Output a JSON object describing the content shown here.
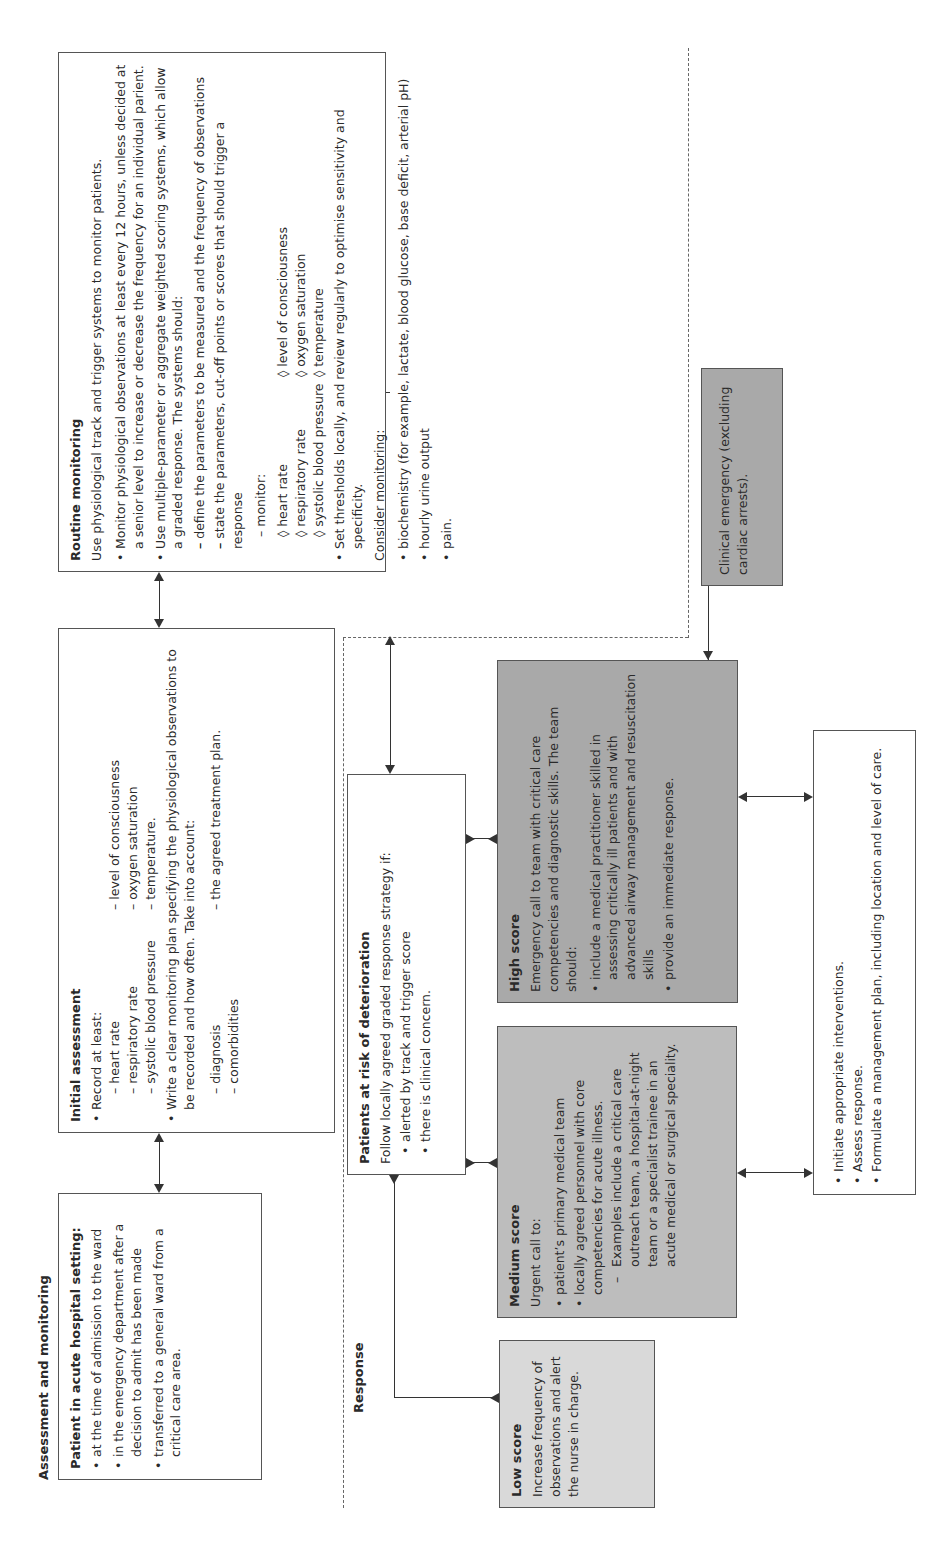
{
  "sections": {
    "assessment_title": "Assessment and monitoring",
    "response_title": "Response"
  },
  "patient_box": {
    "title": "Patient in acute hospital setting:",
    "items": [
      "at the time of admission to the ward",
      "in the emergency department after a decision to admit has been made",
      "transferred to a general ward from a critical care area."
    ]
  },
  "initial_assessment": {
    "title": "Initial assessment",
    "record_label": "Record at least:",
    "record_items": [
      "heart rate",
      "level of consciousness",
      "respiratory rate",
      "oxygen saturation",
      "systolic blood pressure",
      "temperature."
    ],
    "plan_text": "Write a clear monitoring plan specifying the physiological observations to be recorded and how often. Take into account:",
    "plan_items": [
      "diagnosis",
      "the agreed treatment plan.",
      "comorbidities",
      ""
    ]
  },
  "routine_monitoring": {
    "title": "Routine monitoring",
    "intro": "Use physiological track and trigger systems to monitor patients.",
    "bullet1": "Monitor physiological observations at least every 12 hours, unless decided at a senior level to increase or decrease the frequency for an individual parient.",
    "bullet2": "Use multiple-parameter or aggregate weighted scoring systems, which allow a graded response. The systems should:",
    "sub_items": [
      "define the parameters to be measured and the frequency of observations",
      "state the parameters, cut-off points or scores that should trigger a response"
    ],
    "monitor_label": "monitor:",
    "monitor_items": [
      "heart rate",
      "respiratory rate",
      "systolic blood pressure",
      "level of consciousness",
      "oxygen saturation",
      "temperature"
    ],
    "bullet3": "Set thresholds locally, and review regularly to optimise sensitivity and specificity.",
    "consider_label": "Consider monitoring:",
    "consider_items": [
      "biochemistry (for example, lactate, blood glucose, base deficit, arterial pH)",
      "hourly urine output",
      "pain."
    ]
  },
  "clinical_emergency": {
    "text": "Clinical emergency (excluding cardiac arrests)."
  },
  "at_risk": {
    "title": "Patients at risk of deterioration",
    "intro": "Follow locally agreed graded response strategy if:",
    "items": [
      "alerted by track and trigger score",
      "there is clinical concern."
    ]
  },
  "low_score": {
    "title": "Low score",
    "text": "Increase frequency of observations and alert the nurse in charge."
  },
  "medium_score": {
    "title": "Medium score",
    "intro": "Urgent call to:",
    "items": [
      "patient’s primary medical team",
      "locally agreed personnel with core competencies for acute illness."
    ],
    "sub_item": "Examples include a critical care outreach team, a hospital-at-night team or a specialist trainee in an acute medical or surgical speciality."
  },
  "high_score": {
    "title": "High score",
    "intro": "Emergency call to team with critical care competencies and diagnostic skills. The team should:",
    "items": [
      "include a medical practitioner skilled in assessing critically ill patients and with advanced airway management and resuscitation skills",
      "provide an immediate response."
    ]
  },
  "interventions": {
    "items": [
      "Initiate appropriate interventions.",
      "Assess response.",
      "Formulate a management plan, including location and level of care."
    ]
  },
  "colors": {
    "low_fill": "#d9d9d9",
    "medium_fill": "#bdbdbd",
    "high_fill": "#a9a9a9",
    "emergency_fill": "#a9a9a9",
    "border": "#555555"
  }
}
